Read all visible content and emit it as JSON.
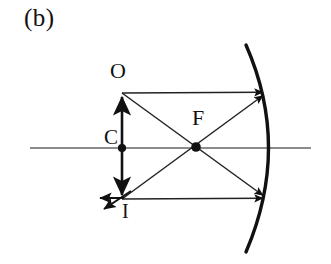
{
  "figure": {
    "panel_label": "(b)",
    "type": "optics-ray-diagram",
    "labels": {
      "object": "O",
      "center_of_curvature": "C",
      "image": "I",
      "focal_point": "F"
    },
    "colors": {
      "ink": "#111111",
      "axis": "#555555",
      "background": "#ffffff"
    },
    "geometry": {
      "optical_axis": {
        "x1": 30,
        "y1": 148,
        "x2": 311,
        "y2": 148
      },
      "object_arrow": {
        "x": 122,
        "y_top": 93,
        "y_bottom": 199
      },
      "center_dot": {
        "x": 122,
        "y": 148
      },
      "focal_dot": {
        "x": 196,
        "y": 147
      },
      "mirror": {
        "top_x": 246,
        "top_y": 45,
        "vertex_x": 278,
        "vertex_y": 147,
        "bottom_x": 246,
        "bottom_y": 252
      },
      "ray_top_horizontal": {
        "x1": 122,
        "y1": 93,
        "x2": 267,
        "y2": 92
      },
      "ray_bottom_horizontal": {
        "x1": 122,
        "y1": 199,
        "x2": 267,
        "y2": 198
      },
      "ray_diagonal_down": {
        "x1": 122,
        "y1": 93,
        "x2": 267,
        "y2": 198
      },
      "ray_diagonal_up": {
        "x1": 122,
        "y1": 199,
        "x2": 267,
        "y2": 92
      },
      "reflected_ray_left": {
        "x1": 122,
        "y1": 198,
        "x2": 97,
        "y2": 198
      },
      "reflected_ray_diagonal": {
        "x1": 130,
        "y1": 192,
        "x2": 101,
        "y2": 211
      }
    }
  }
}
